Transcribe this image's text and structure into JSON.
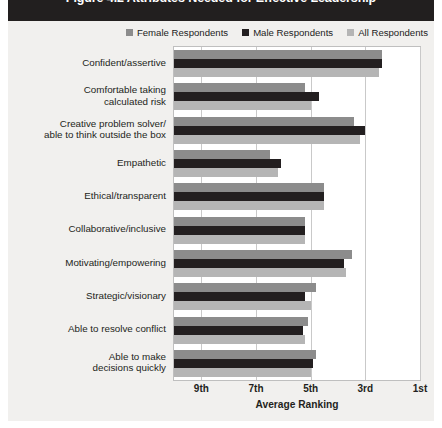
{
  "figure": {
    "title": "Figure 4.2 Attributes Needed for Effective Leadership",
    "title_band_color": "#221f1f",
    "panel_color": "#f1f0ee"
  },
  "legend": {
    "position": "top-right",
    "items": [
      {
        "label": "Female Respondents",
        "color": "#8c8c8c",
        "icon": "legend-swatch-icon"
      },
      {
        "label": "Male Respondents",
        "color": "#231f20",
        "icon": "legend-swatch-icon"
      },
      {
        "label": "All Respondents",
        "color": "#b5b5b5",
        "icon": "legend-swatch-icon"
      }
    ]
  },
  "axis": {
    "x_title": "Average Ranking",
    "x_ticks": [
      "9th",
      "7th",
      "5th",
      "3rd",
      "1st"
    ],
    "x_tick_values": [
      9,
      7,
      5,
      3,
      1
    ],
    "x_min_rank": 10,
    "x_max_rank": 1
  },
  "chart_data": {
    "type": "bar",
    "orientation": "horizontal",
    "title": "Figure 4.2 Attributes Needed for Effective Leadership",
    "xlabel": "Average Ranking",
    "ylabel": "",
    "xlim": [
      10,
      1
    ],
    "x_ticks": [
      "9th",
      "7th",
      "5th",
      "3rd",
      "1st"
    ],
    "grid": true,
    "legend_position": "top-right",
    "categories": [
      "Confident/assertive",
      "Comfortable taking calculated risk",
      "Creative problem solver/ able to think outside the box",
      "Empathetic",
      "Ethical/transparent",
      "Collaborative/inclusive",
      "Motivating/empowering",
      "Strategic/visionary",
      "Able to resolve conflict",
      "Able to make decisions quickly"
    ],
    "series": [
      {
        "name": "Female Respondents",
        "color": "#8c8c8c",
        "values": [
          2.4,
          5.2,
          3.4,
          6.5,
          4.5,
          5.2,
          3.5,
          4.8,
          5.1,
          4.8
        ]
      },
      {
        "name": "Male Respondents",
        "color": "#231f20",
        "values": [
          2.4,
          4.7,
          3.0,
          6.1,
          4.5,
          5.2,
          3.8,
          5.2,
          5.3,
          4.9
        ]
      },
      {
        "name": "All Respondents",
        "color": "#b5b5b5",
        "values": [
          2.5,
          5.0,
          3.2,
          6.2,
          4.5,
          5.2,
          3.7,
          5.0,
          5.2,
          5.0
        ]
      }
    ]
  },
  "categories_display": [
    {
      "lines": [
        "Confident/assertive"
      ]
    },
    {
      "lines": [
        "Comfortable taking",
        "calculated risk"
      ]
    },
    {
      "lines": [
        "Creative problem solver/",
        "able to think outside the box"
      ]
    },
    {
      "lines": [
        "Empathetic"
      ]
    },
    {
      "lines": [
        "Ethical/transparent"
      ]
    },
    {
      "lines": [
        "Collaborative/inclusive"
      ]
    },
    {
      "lines": [
        "Motivating/empowering"
      ]
    },
    {
      "lines": [
        "Strategic/visionary"
      ]
    },
    {
      "lines": [
        "Able to resolve conflict"
      ]
    },
    {
      "lines": [
        "Able to make",
        "decisions quickly"
      ]
    }
  ]
}
